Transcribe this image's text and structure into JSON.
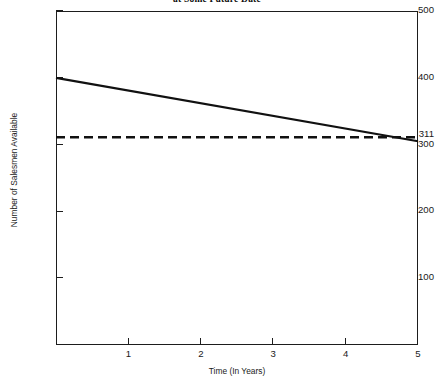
{
  "chart_data": {
    "type": "line",
    "title": "at Some Future Date",
    "xlabel": "Time (In Years)",
    "ylabel": "Number of Salesmen Available",
    "xlim": [
      0,
      5
    ],
    "ylim": [
      0,
      500
    ],
    "grid": false,
    "legend": null,
    "x_ticks": [
      {
        "value": 1,
        "label": "1"
      },
      {
        "value": 2,
        "label": "2"
      },
      {
        "value": 3,
        "label": "3"
      },
      {
        "value": 4,
        "label": "4"
      },
      {
        "value": 5,
        "label": "5"
      }
    ],
    "y_ticks": [
      {
        "value": 100,
        "label": "100"
      },
      {
        "value": 200,
        "label": "200"
      },
      {
        "value": 300,
        "label": "300"
      },
      {
        "value": 400,
        "label": "400"
      },
      {
        "value": 500,
        "label": "500"
      }
    ],
    "y_special_labels": [
      {
        "value": 311,
        "label": "311"
      }
    ],
    "series": [
      {
        "name": "Salesmen Available",
        "style": "solid",
        "color": "#111111",
        "x": [
          0,
          5
        ],
        "values": [
          400,
          305
        ]
      },
      {
        "name": "Salesmen Required",
        "style": "dashed",
        "color": "#111111",
        "x": [
          0,
          5
        ],
        "values": [
          311,
          311
        ]
      }
    ]
  },
  "axes": {
    "y_title": "Number of Salesmen Available",
    "x_title": "Time (In Years)"
  },
  "header": {
    "title": "at Some Future Date"
  }
}
